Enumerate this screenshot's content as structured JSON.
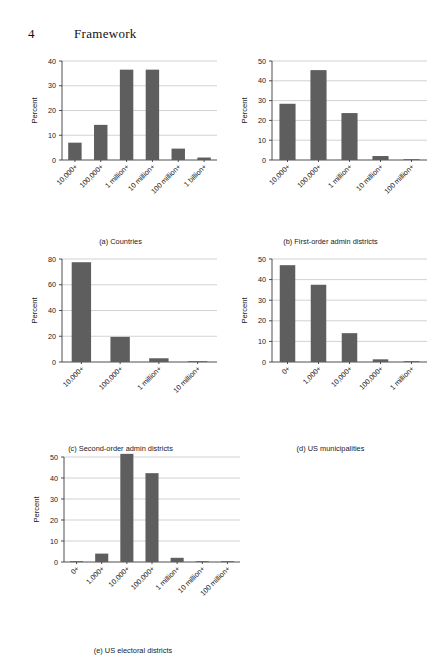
{
  "header": {
    "folio": "4",
    "chapter_title": "Framework"
  },
  "colors": {
    "bar": "#5e5e5e",
    "gridline": "#9a9a9a",
    "axis": "#3a3a3a",
    "text": "#1a1a1a",
    "background": "#ffffff"
  },
  "chart_data": [
    {
      "id": "a",
      "type": "bar",
      "title": "(a) Countries",
      "xlabel": "",
      "ylabel": "Percent",
      "categories": [
        "10,000+",
        "100,000+",
        "1 million+",
        "10 million+",
        "100 million+",
        "1 billion+"
      ],
      "values": [
        7.0,
        14.2,
        36.5,
        36.5,
        4.6,
        1.0
      ],
      "ylim": [
        0,
        40
      ],
      "yticks": [
        0,
        10,
        20,
        30,
        40
      ],
      "grid": true,
      "legend": "none"
    },
    {
      "id": "b",
      "type": "bar",
      "title": "(b) First-order admin districts",
      "xlabel": "",
      "ylabel": "Percent",
      "categories": [
        "10,000+",
        "100,000+",
        "1 million+",
        "10 million+",
        "100 million+"
      ],
      "values": [
        28.4,
        45.4,
        23.7,
        2.0,
        0.4
      ],
      "ylim": [
        0,
        50
      ],
      "yticks": [
        0,
        10,
        20,
        30,
        40,
        50
      ],
      "grid": true,
      "legend": "none"
    },
    {
      "id": "c",
      "type": "bar",
      "title": "(c) Second-order admin districts",
      "xlabel": "",
      "ylabel": "Percent",
      "categories": [
        "10,000+",
        "100,000+",
        "1 million+",
        "10 million+"
      ],
      "values": [
        77.5,
        19.5,
        2.9,
        0.4
      ],
      "ylim": [
        0,
        80
      ],
      "yticks": [
        0,
        20,
        40,
        60,
        80
      ],
      "grid": true,
      "legend": "none"
    },
    {
      "id": "d",
      "type": "bar",
      "title": "(d) US municipalities",
      "xlabel": "",
      "ylabel": "Percent",
      "categories": [
        "0+",
        "1,000+",
        "10,000+",
        "100,000+",
        "1 million+"
      ],
      "values": [
        47.0,
        37.5,
        14.0,
        1.3,
        0.3
      ],
      "ylim": [
        0,
        50
      ],
      "yticks": [
        0,
        10,
        20,
        30,
        40,
        50
      ],
      "grid": true,
      "legend": "none"
    },
    {
      "id": "e",
      "type": "bar",
      "title": "(e) US electoral districts",
      "xlabel": "",
      "ylabel": "Percent",
      "categories": [
        "0+",
        "1,000+",
        "10,000+",
        "100,000+",
        "1 million+",
        "10 million+",
        "100 million+"
      ],
      "values": [
        0.3,
        4.0,
        51.5,
        42.3,
        2.0,
        0.3,
        0.3
      ],
      "ylim": [
        0,
        50
      ],
      "yticks": [
        0,
        10,
        20,
        30,
        40,
        50
      ],
      "grid": true,
      "legend": "none"
    }
  ]
}
